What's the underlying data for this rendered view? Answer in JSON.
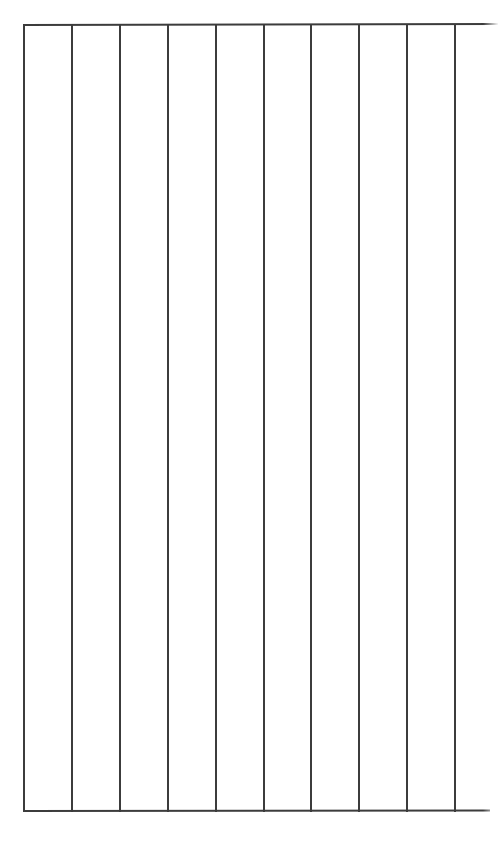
{
  "document": {
    "kind": "blank-ruled-column-form",
    "background_color": "#ffffff",
    "rule_color": "#3c3c3c",
    "page_width": 501,
    "page_height": 841,
    "has_text": false,
    "text_content": "",
    "title": "",
    "notes": ""
  },
  "grid": {
    "column_count": 10,
    "row_count": 1,
    "column_spacing_px": 48,
    "block_left_px": 23,
    "block_top_px": 24,
    "block_bottom_px": 810,
    "vertical_rule_x": [
      23,
      71,
      119,
      167,
      215,
      263,
      310,
      358,
      406,
      454
    ],
    "horizontal_rules": [
      {
        "name": "top-rule",
        "y": 24,
        "x_start": 23,
        "x_end": 498
      },
      {
        "name": "bottom-rule",
        "y": 810,
        "x_start": 23,
        "x_end": 490
      }
    ],
    "column_headers": [
      "",
      "",
      "",
      "",
      "",
      "",
      "",
      "",
      "",
      ""
    ],
    "cells": [
      {
        "index": 0,
        "value": ""
      },
      {
        "index": 1,
        "value": ""
      },
      {
        "index": 2,
        "value": ""
      },
      {
        "index": 3,
        "value": ""
      },
      {
        "index": 4,
        "value": ""
      },
      {
        "index": 5,
        "value": ""
      },
      {
        "index": 6,
        "value": ""
      },
      {
        "index": 7,
        "value": ""
      },
      {
        "index": 8,
        "value": ""
      },
      {
        "index": 9,
        "value": ""
      }
    ]
  }
}
